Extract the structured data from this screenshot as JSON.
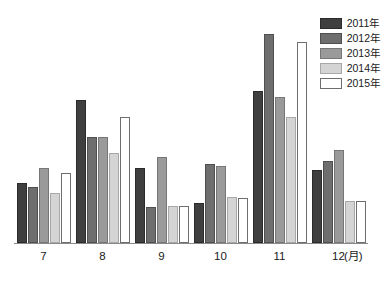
{
  "chart_data": {
    "type": "bar",
    "title": "",
    "subtitle": "",
    "xlabel": "(月)",
    "ylabel": "",
    "categories": [
      "7",
      "8",
      "9",
      "10",
      "11",
      "12"
    ],
    "grid": false,
    "legend_position": "top-right",
    "ylim": [
      0,
      170
    ],
    "axis": {
      "x_unit_label": "(月)",
      "y_axis_visible": false,
      "x_axis_visible": true,
      "tick_labels_x": [
        "7",
        "8",
        "9",
        "10",
        "11",
        "12"
      ]
    },
    "series": [
      {
        "name": "2011年",
        "color": "#3f3f3f",
        "border": "#2b2b2b",
        "values": [
          45,
          108,
          57,
          30,
          115,
          55
        ]
      },
      {
        "name": "2012年",
        "color": "#6e6e6e",
        "border": "#4f4f4f",
        "values": [
          42,
          80,
          27,
          60,
          158,
          62
        ]
      },
      {
        "name": "2013年",
        "color": "#9a9a9a",
        "border": "#767676",
        "values": [
          57,
          80,
          65,
          58,
          110,
          70
        ]
      },
      {
        "name": "2014年",
        "color": "#d4d4d4",
        "border": "#a8a8a8",
        "values": [
          38,
          68,
          28,
          35,
          95,
          32
        ]
      },
      {
        "name": "2015年",
        "color": "#ffffff",
        "border": "#6e6e6e",
        "values": [
          53,
          95,
          28,
          34,
          152,
          32
        ]
      }
    ]
  },
  "legend": {
    "items": [
      {
        "label": "2011年",
        "color": "#3f3f3f",
        "border": "#2b2b2b"
      },
      {
        "label": "2012年",
        "color": "#6e6e6e",
        "border": "#4f4f4f"
      },
      {
        "label": "2013年",
        "color": "#9a9a9a",
        "border": "#767676"
      },
      {
        "label": "2014年",
        "color": "#d4d4d4",
        "border": "#a8a8a8"
      },
      {
        "label": "2015年",
        "color": "#ffffff",
        "border": "#6e6e6e"
      }
    ]
  },
  "colors": {
    "background": "#ffffff",
    "axis_line": "#8a8a8a",
    "text": "#1a1a1a"
  }
}
